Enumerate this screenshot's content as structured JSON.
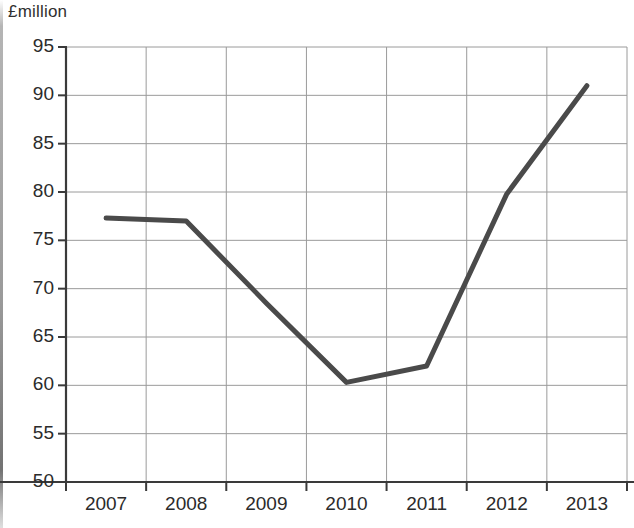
{
  "chart_data": {
    "type": "line",
    "title": "",
    "subtitle": "",
    "xlabel": "",
    "ylabel": "£million",
    "categories": [
      "2007",
      "2008",
      "2009",
      "2010",
      "2011",
      "2012",
      "2013"
    ],
    "series": [
      {
        "name": "",
        "values": [
          77.3,
          77.0,
          68.5,
          60.3,
          62.0,
          79.8,
          91.0
        ]
      }
    ],
    "ylim": [
      50,
      95
    ],
    "yticks": [
      50,
      55,
      60,
      65,
      70,
      75,
      80,
      85,
      90,
      95
    ],
    "ytick_labels": [
      "50",
      "55",
      "60",
      "65",
      "70",
      "75",
      "80",
      "85",
      "90",
      "95"
    ],
    "xticks": [
      "2007",
      "2008",
      "2009",
      "2010",
      "2011",
      "2012",
      "2013"
    ],
    "grid": true,
    "grid_axes": "both",
    "legend": false,
    "legend_position": "none",
    "line_color": "#4a4a4a",
    "line_width": 5,
    "markers": false,
    "annotations": []
  },
  "style": {
    "background": "#ffffff",
    "axis_color": "#3a3a3a",
    "grid_color": "#9a9a9a",
    "text_color": "#2b2b2b"
  }
}
